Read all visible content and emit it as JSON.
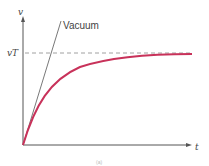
{
  "diagram": {
    "y_axis_label": "v",
    "x_axis_label": "t",
    "terminal_velocity_label": "vT",
    "vacuum_label": "Vacuum",
    "caption": "(a)",
    "colors": {
      "curve": "#c8325a",
      "axes": "#555555",
      "dashed_line": "#888888",
      "vacuum_line": "#555555"
    }
  }
}
